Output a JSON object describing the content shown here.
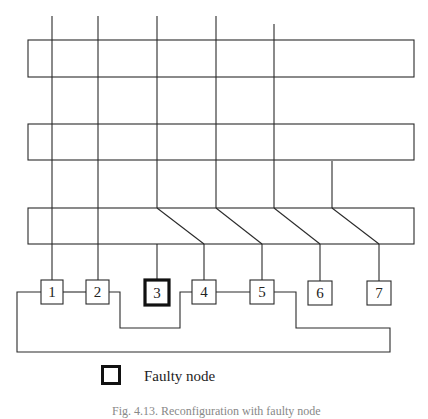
{
  "diagram": {
    "type": "multi-bus reconfiguration diagram",
    "buses": [
      {
        "id": "bus-1",
        "x": 28,
        "y": 40,
        "w": 386,
        "h": 37
      },
      {
        "id": "bus-2",
        "x": 28,
        "y": 124,
        "w": 386,
        "h": 36
      },
      {
        "id": "bus-3",
        "x": 28,
        "y": 208,
        "w": 386,
        "h": 36
      }
    ],
    "nodes": [
      {
        "id": "1",
        "label": "1",
        "faulty": false
      },
      {
        "id": "2",
        "label": "2",
        "faulty": false
      },
      {
        "id": "3",
        "label": "3",
        "faulty": true
      },
      {
        "id": "4",
        "label": "4",
        "faulty": false
      },
      {
        "id": "5",
        "label": "5",
        "faulty": false
      },
      {
        "id": "6",
        "label": "6",
        "faulty": false
      },
      {
        "id": "7",
        "label": "7",
        "faulty": false
      }
    ],
    "links": [
      {
        "from": "1",
        "to": "2"
      },
      {
        "from": "2",
        "to": "4"
      },
      {
        "from": "4",
        "to": "5"
      },
      {
        "from": "5",
        "to": "1",
        "via": "bottom loop"
      }
    ]
  },
  "legend": {
    "faulty_node_label": "Faulty node"
  },
  "caption": "Fig. 4.13. Reconfiguration with faulty node"
}
